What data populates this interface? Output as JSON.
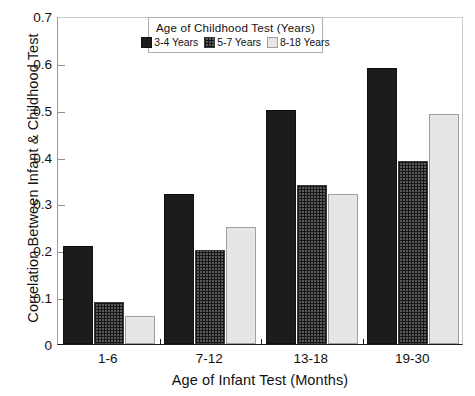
{
  "chart_data": {
    "type": "bar",
    "title": "",
    "xlabel": "Age of Infant Test (Months)",
    "ylabel": "Correlation Between Infant & Childhood Test",
    "categories": [
      "1-6",
      "7-12",
      "13-18",
      "19-30"
    ],
    "series": [
      {
        "name": "3-4 Years",
        "values": [
          0.21,
          0.32,
          0.5,
          0.59
        ]
      },
      {
        "name": "5-7 Years",
        "values": [
          0.09,
          0.2,
          0.34,
          0.39
        ]
      },
      {
        "name": "8-18 Years",
        "values": [
          0.06,
          0.25,
          0.32,
          0.49
        ]
      }
    ],
    "ylim": [
      0,
      0.7
    ],
    "yticks": [
      "0",
      "0.1",
      "0.2",
      "0.3",
      "0.4",
      "0.5",
      "0.6",
      "0.7"
    ],
    "ytick_values": [
      0,
      0.1,
      0.2,
      0.3,
      0.4,
      0.5,
      0.6,
      0.7
    ],
    "grid": false,
    "legend_position": "top-center",
    "legend_title": "Age of Childhood Test (Years)",
    "colors": {
      "series_0": "#1c1c1c",
      "series_1": "#5a5a5a",
      "series_2": "#e6e6e6",
      "axis": "#1a1a1a",
      "background": "#ffffff"
    }
  }
}
